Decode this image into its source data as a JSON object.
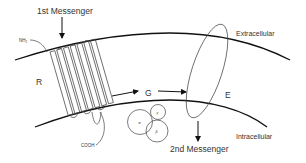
{
  "diagram": {
    "labels": {
      "first_messenger": "1st Messenger",
      "second_messenger": "2nd Messenger",
      "extracellular": "Extracellular",
      "intracellular": "Intracellular",
      "receptor": "R",
      "g_protein": "G",
      "effector": "E",
      "n_terminus": "NH₂",
      "c_terminus": "COOH"
    },
    "subunits": [
      {
        "id": "alpha",
        "label": "α"
      },
      {
        "id": "gamma",
        "label": "γ"
      },
      {
        "id": "beta",
        "label": "β"
      }
    ],
    "colors": {
      "line": "#111111",
      "text": "#333333",
      "background": "#ffffff"
    }
  }
}
